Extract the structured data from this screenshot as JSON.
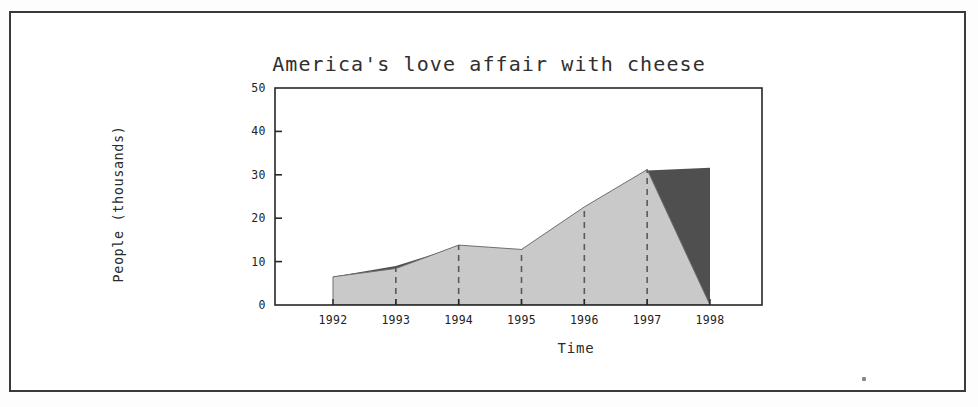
{
  "figure": {
    "border_color": "#3a3a3a",
    "background": "#ffffff",
    "artifact_speck": "scan-speck"
  },
  "chart_data": {
    "type": "area",
    "title": "America's love affair with cheese",
    "xlabel": "Time",
    "ylabel": "People (thousands)",
    "x": [
      1992,
      1993,
      1994,
      1995,
      1996,
      1997,
      1998
    ],
    "categories": [
      "1992",
      "1993",
      "1994",
      "1995",
      "1996",
      "1997",
      "1998"
    ],
    "xtick_labels": [
      "1992",
      "1993",
      "1994",
      "1995",
      "1996",
      "1997",
      "1998"
    ],
    "ytick_labels": [
      "0",
      "10",
      "20",
      "30",
      "40",
      "50"
    ],
    "ytick_values": [
      0,
      10,
      20,
      30,
      40,
      50
    ],
    "ylim": [
      0,
      50
    ],
    "xlim": [
      1992,
      1998
    ],
    "grid": "dashed-vertical",
    "gridline_years": [
      "1993",
      "1994",
      "1995",
      "1996",
      "1997"
    ],
    "legend": "none",
    "series": [
      {
        "name": "light-area",
        "color": "#c9c9c9",
        "values": [
          6.5,
          8.4,
          13.8,
          12.8,
          22.6,
          31.2,
          0
        ]
      },
      {
        "name": "dark-area",
        "color": "#4f4f4f",
        "values": [
          6.5,
          9.0,
          13.5,
          12.6,
          22.4,
          31.0,
          31.6
        ]
      }
    ],
    "notes": [
      "Light gray region rises from 6.5 in 1992 to a peak of 31.2 at 1997, then falls to 0 at 1998.",
      "Dark gray region shows a thin sliver just before 1993 and a large wedge from the 1997 peak up to 31.6 at 1998."
    ]
  }
}
